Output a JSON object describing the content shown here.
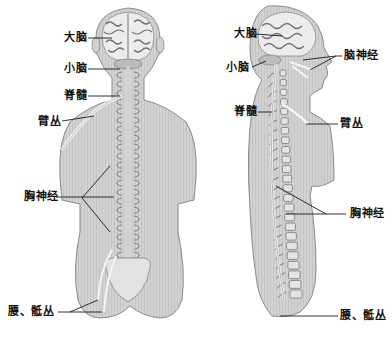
{
  "figure": {
    "views": [
      {
        "id": "back-view",
        "name": "Posterior view"
      },
      {
        "id": "side-view",
        "name": "Lateral view"
      }
    ],
    "colors": {
      "skin": "#d4d4d4",
      "skin_shade": "#bdbdbd",
      "outline": "#8a8a8a",
      "brain": "#e9e9e9",
      "brain_fold": "#777777",
      "nerve": "#f2f2f2",
      "leader": "#1a1a1a"
    },
    "back_labels": {
      "cerebrum": "大脑",
      "cerebellum": "小脑",
      "spinal_cord": "脊髓",
      "brachial_plexus": "臂丛",
      "thoracic_nerves": "胸神经",
      "lumbosacral_plexus": "腰、骶丛"
    },
    "side_labels": {
      "cerebrum": "大脑",
      "cerebellum": "小脑",
      "cranial_nerves": "脑神经",
      "spinal_cord": "脊髓",
      "brachial_plexus": "臂丛",
      "thoracic_nerves": "胸神经",
      "lumbosacral_plexus": "腰、骶丛"
    }
  }
}
